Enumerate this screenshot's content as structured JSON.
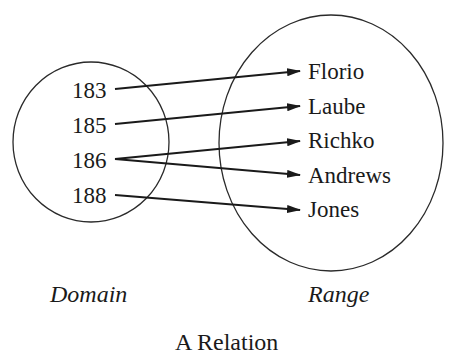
{
  "title": "A Relation",
  "domain": {
    "label": "Domain",
    "items": [
      "183",
      "185",
      "186",
      "188"
    ]
  },
  "range": {
    "label": "Range",
    "items": [
      "Florio",
      "Laube",
      "Richko",
      "Andrews",
      "Jones"
    ]
  },
  "mappings": [
    {
      "from": "183",
      "to": "Florio"
    },
    {
      "from": "185",
      "to": "Laube"
    },
    {
      "from": "186",
      "to": "Richko"
    },
    {
      "from": "186",
      "to": "Andrews"
    },
    {
      "from": "188",
      "to": "Jones"
    }
  ],
  "colors": {
    "ink": "#1a1a1a",
    "background": "#ffffff"
  }
}
